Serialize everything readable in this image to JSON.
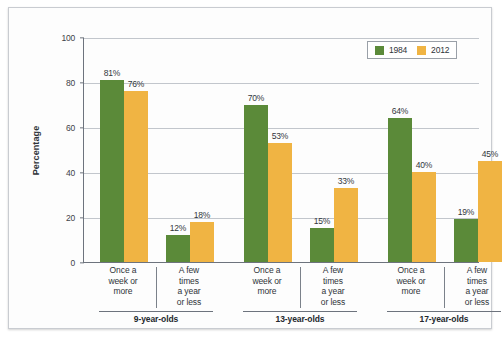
{
  "chart_data": {
    "type": "bar",
    "title": "",
    "xlabel": "",
    "ylabel": "Percentage",
    "ylim": [
      0,
      100
    ],
    "yticks": [
      0,
      20,
      40,
      60,
      80,
      100
    ],
    "grid": true,
    "legend_position": "top-right",
    "categories": [
      "Once a week or more",
      "A few times a year or less",
      "Once a week or more",
      "A few times a year or less",
      "Once a week or more",
      "A few times a year or less"
    ],
    "groups": [
      "9-year-olds",
      "13-year-olds",
      "17-year-olds"
    ],
    "series": [
      {
        "name": "1984",
        "color": "#5b8a39",
        "values": [
          81,
          12,
          70,
          15,
          64,
          19
        ]
      },
      {
        "name": "2012",
        "color": "#f0b443",
        "values": [
          76,
          18,
          53,
          33,
          40,
          45
        ]
      }
    ],
    "value_labels": [
      [
        "81%",
        "12%",
        "70%",
        "15%",
        "64%",
        "19%"
      ],
      [
        "76%",
        "18%",
        "53%",
        "33%",
        "40%",
        "45%"
      ]
    ]
  },
  "axis": {
    "ylabel": "Percentage",
    "ytick_labels": [
      "100",
      "80",
      "60",
      "40",
      "20",
      "0"
    ]
  },
  "legend": {
    "items": [
      {
        "label": "1984",
        "color": "#5b8a39"
      },
      {
        "label": "2012",
        "color": "#f0b443"
      }
    ]
  },
  "categories": [
    {
      "lines": [
        "Once a",
        "week or",
        "more"
      ]
    },
    {
      "lines": [
        "A few",
        "times",
        "a year",
        "or less"
      ]
    },
    {
      "lines": [
        "Once a",
        "week or",
        "more"
      ]
    },
    {
      "lines": [
        "A few",
        "times",
        "a year",
        "or less"
      ]
    },
    {
      "lines": [
        "Once a",
        "week or",
        "more"
      ]
    },
    {
      "lines": [
        "A few",
        "times",
        "a year",
        "or less"
      ]
    }
  ],
  "groups": [
    {
      "label": "9-year-olds"
    },
    {
      "label": "13-year-olds"
    },
    {
      "label": "17-year-olds"
    }
  ]
}
